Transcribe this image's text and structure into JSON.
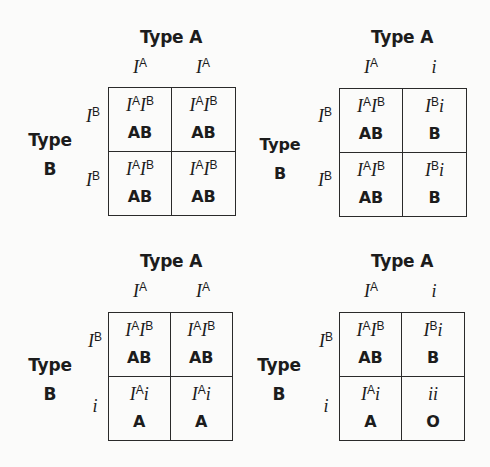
{
  "diagram": {
    "type": "punnett-squares",
    "squares": [
      {
        "id": "top-left",
        "col_parent": "Type A",
        "row_parent_line1": "Type",
        "row_parent_line2": "B",
        "col_alleles": [
          {
            "base": "I",
            "sup": "A"
          },
          {
            "base": "I",
            "sup": "A"
          }
        ],
        "row_alleles": [
          {
            "base": "I",
            "sup": "B"
          },
          {
            "base": "I",
            "sup": "B"
          }
        ],
        "cells": [
          [
            {
              "g1": "I",
              "s1": "A",
              "g2": "I",
              "s2": "B",
              "phenotype": "AB"
            },
            {
              "g1": "I",
              "s1": "A",
              "g2": "I",
              "s2": "B",
              "phenotype": "AB"
            }
          ],
          [
            {
              "g1": "I",
              "s1": "A",
              "g2": "I",
              "s2": "B",
              "phenotype": "AB"
            },
            {
              "g1": "I",
              "s1": "A",
              "g2": "I",
              "s2": "B",
              "phenotype": "AB"
            }
          ]
        ]
      },
      {
        "id": "top-right",
        "col_parent": "Type A",
        "row_parent_line1": "Type",
        "row_parent_line2": "B",
        "col_alleles": [
          {
            "base": "I",
            "sup": "A"
          },
          {
            "base": "i",
            "sup": ""
          }
        ],
        "row_alleles": [
          {
            "base": "I",
            "sup": "B"
          },
          {
            "base": "I",
            "sup": "B"
          }
        ],
        "cells": [
          [
            {
              "g1": "I",
              "s1": "A",
              "g2": "I",
              "s2": "B",
              "phenotype": "AB"
            },
            {
              "g1": "I",
              "s1": "B",
              "g2": "i",
              "s2": "",
              "phenotype": "B"
            }
          ],
          [
            {
              "g1": "I",
              "s1": "A",
              "g2": "I",
              "s2": "B",
              "phenotype": "AB"
            },
            {
              "g1": "I",
              "s1": "B",
              "g2": "i",
              "s2": "",
              "phenotype": "B"
            }
          ]
        ]
      },
      {
        "id": "bottom-left",
        "col_parent": "Type A",
        "row_parent_line1": "Type",
        "row_parent_line2": "B",
        "col_alleles": [
          {
            "base": "I",
            "sup": "A"
          },
          {
            "base": "I",
            "sup": "A"
          }
        ],
        "row_alleles": [
          {
            "base": "I",
            "sup": "B"
          },
          {
            "base": "i",
            "sup": ""
          }
        ],
        "cells": [
          [
            {
              "g1": "I",
              "s1": "A",
              "g2": "I",
              "s2": "B",
              "phenotype": "AB"
            },
            {
              "g1": "I",
              "s1": "A",
              "g2": "I",
              "s2": "B",
              "phenotype": "AB"
            }
          ],
          [
            {
              "g1": "I",
              "s1": "A",
              "g2": "i",
              "s2": "",
              "phenotype": "A"
            },
            {
              "g1": "I",
              "s1": "A",
              "g2": "i",
              "s2": "",
              "phenotype": "A"
            }
          ]
        ]
      },
      {
        "id": "bottom-right",
        "col_parent": "Type A",
        "row_parent_line1": "Type",
        "row_parent_line2": "B",
        "col_alleles": [
          {
            "base": "I",
            "sup": "A"
          },
          {
            "base": "i",
            "sup": ""
          }
        ],
        "row_alleles": [
          {
            "base": "I",
            "sup": "B"
          },
          {
            "base": "i",
            "sup": ""
          }
        ],
        "cells": [
          [
            {
              "g1": "I",
              "s1": "A",
              "g2": "I",
              "s2": "B",
              "phenotype": "AB"
            },
            {
              "g1": "I",
              "s1": "B",
              "g2": "i",
              "s2": "",
              "phenotype": "B"
            }
          ],
          [
            {
              "g1": "I",
              "s1": "A",
              "g2": "i",
              "s2": "",
              "phenotype": "A"
            },
            {
              "g1": "i",
              "s1": "",
              "g2": "i",
              "s2": "",
              "phenotype": "O"
            }
          ]
        ]
      }
    ],
    "colors": {
      "text": "#1c1c1c",
      "grid_line": "#2a2a2a",
      "background": "#fbfbfa"
    }
  }
}
